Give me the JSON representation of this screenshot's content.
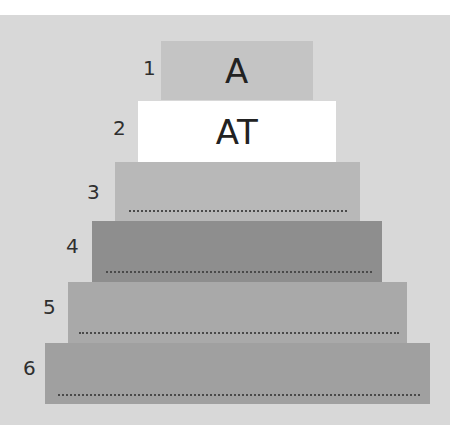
{
  "diagram": {
    "type": "stepped-pyramid",
    "background_color": "#d8d8d8",
    "tiers": [
      {
        "number": "1",
        "text": "A",
        "color": "#c4c4c4",
        "has_blank_line": false
      },
      {
        "number": "2",
        "text": "AT",
        "color": "#ffffff",
        "has_blank_line": false
      },
      {
        "number": "3",
        "text": "",
        "color": "#b8b8b8",
        "has_blank_line": true
      },
      {
        "number": "4",
        "text": "",
        "color": "#8e8e8e",
        "has_blank_line": true
      },
      {
        "number": "5",
        "text": "",
        "color": "#a9a9a9",
        "has_blank_line": true
      },
      {
        "number": "6",
        "text": "",
        "color": "#a0a0a0",
        "has_blank_line": true
      }
    ]
  }
}
